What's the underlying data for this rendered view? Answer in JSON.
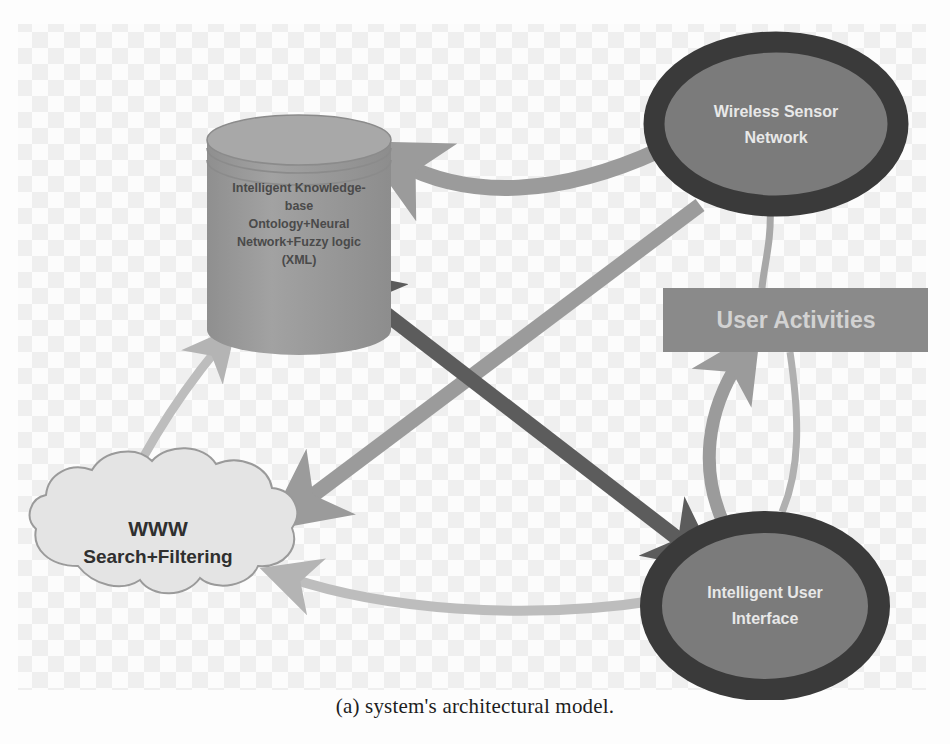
{
  "caption": "(a) system's architectural model.",
  "figure": {
    "background": {
      "type": "checkerboard-transparency",
      "light": "#fbfbfb",
      "dark": "#eeeeee",
      "cell_size": 16
    },
    "nodes": [
      {
        "id": "knowledge-base",
        "shape": "cylinder",
        "lines": [
          "Intelligent Knowledge-",
          "base",
          "Ontology+Neural",
          "Network+Fuzzy logic",
          "(XML)"
        ],
        "fill": "#9a9a9a",
        "text_color": "#4a4a4a"
      },
      {
        "id": "wireless-sensor-network",
        "shape": "ellipse",
        "lines": [
          "Wireless Sensor",
          "Network"
        ],
        "fill": "#7b7b7b",
        "border": "#3a3a3a",
        "text_color": "#e8e8e8"
      },
      {
        "id": "user-activities",
        "shape": "rectangle",
        "lines": [
          "User Activities"
        ],
        "fill": "#8a8a8a",
        "text_color": "#d2d2d2"
      },
      {
        "id": "intelligent-user-interface",
        "shape": "ellipse",
        "lines": [
          "Intelligent User",
          "Interface"
        ],
        "fill": "#7b7b7b",
        "border": "#3a3a3a",
        "text_color": "#e8e8e8"
      },
      {
        "id": "www-cloud",
        "shape": "cloud",
        "lines": [
          "WWW",
          "Search+Filtering"
        ],
        "fill": "#e4e4e4",
        "border": "#9a9a9a",
        "text_color": "#2f2f2f"
      }
    ],
    "connectors": [
      {
        "id": "wsn-to-kb",
        "from": "wireless-sensor-network",
        "to": "knowledge-base",
        "style": "thick-gray-arrow",
        "color": "#9b9b9b",
        "arrowheads": "to"
      },
      {
        "id": "kb-to-iui",
        "from": "knowledge-base",
        "to": "intelligent-user-interface",
        "style": "thick-dark-arrow",
        "color": "#5c5c5c",
        "arrowheads": "both"
      },
      {
        "id": "wsn-to-www",
        "from": "wireless-sensor-network",
        "to": "www-cloud",
        "style": "thick-gray-arrow",
        "color": "#9b9b9b",
        "arrowheads": "to"
      },
      {
        "id": "www-to-kb",
        "from": "www-cloud",
        "to": "knowledge-base",
        "style": "thin-gray-arrow",
        "color": "#b4b4b4",
        "arrowheads": "to"
      },
      {
        "id": "wsn-to-user-activities",
        "from": "wireless-sensor-network",
        "to": "user-activities",
        "style": "thin-gray-line",
        "color": "#a8a8a8",
        "arrowheads": "none"
      },
      {
        "id": "iui-to-user-activities",
        "from": "intelligent-user-interface",
        "to": "user-activities",
        "style": "curved-gray-arrow",
        "color": "#9b9b9b",
        "arrowheads": "to"
      },
      {
        "id": "user-activities-to-iui",
        "from": "user-activities",
        "to": "intelligent-user-interface",
        "style": "curved-thin-gray-line",
        "color": "#b0b0b0",
        "arrowheads": "none"
      },
      {
        "id": "iui-to-www",
        "from": "intelligent-user-interface",
        "to": "www-cloud",
        "style": "curved-gray-arrow",
        "color": "#b4b4b4",
        "arrowheads": "to"
      }
    ]
  }
}
